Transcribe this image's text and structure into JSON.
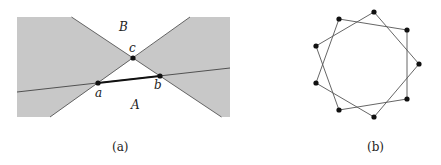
{
  "figure_a": {
    "caption": "(a)",
    "fill_color": "#c8c8c8",
    "line_color": "#555555",
    "points": {
      "a": {
        "label": "a",
        "x": 98,
        "y": 83
      },
      "b": {
        "label": "b",
        "x": 160,
        "y": 76
      },
      "c": {
        "label": "c",
        "x": 133,
        "y": 58
      }
    },
    "regions": {
      "A": {
        "label": "A"
      },
      "B": {
        "label": "B"
      }
    }
  },
  "figure_b": {
    "caption": "(b)",
    "description": "Nine-vertex star polygon {9/2}",
    "vertex_count": 9,
    "line_color": "#555555",
    "vertices": [
      [
        374,
        12
      ],
      [
        407,
        30
      ],
      [
        419,
        64
      ],
      [
        407,
        99
      ],
      [
        374,
        117
      ],
      [
        339,
        110
      ],
      [
        316,
        83
      ],
      [
        316,
        46
      ],
      [
        339,
        19
      ]
    ]
  }
}
